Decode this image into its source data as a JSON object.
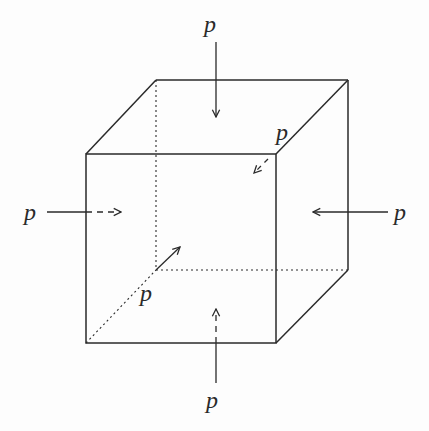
{
  "figure": {
    "type": "cube-under-uniform-pressure",
    "labels": {
      "top": "p",
      "back": "p",
      "left": "p",
      "right": "p",
      "front": "p",
      "bottom": "p"
    },
    "colors": {
      "ink": "#2a2a2a",
      "background": "#fdfdfd",
      "bleed_through": "#e8e8e8"
    }
  }
}
